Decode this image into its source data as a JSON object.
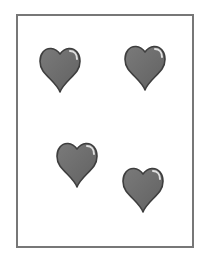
{
  "card": {
    "rank": "4",
    "suit": "hearts",
    "label": "Four of Hearts",
    "border_color": "#777777",
    "background_color": "#ffffff"
  },
  "pips": [
    {
      "icon": "heart-icon",
      "x": 38,
      "y": 44
    },
    {
      "icon": "heart-icon",
      "x": 123,
      "y": 42
    },
    {
      "icon": "heart-icon",
      "x": 55,
      "y": 139
    },
    {
      "icon": "heart-icon",
      "x": 121,
      "y": 164
    }
  ],
  "colors": {
    "heart_fill": "#6e6e6e",
    "heart_stroke": "#3e3e3e",
    "heart_highlight": "#d8d8d8"
  }
}
